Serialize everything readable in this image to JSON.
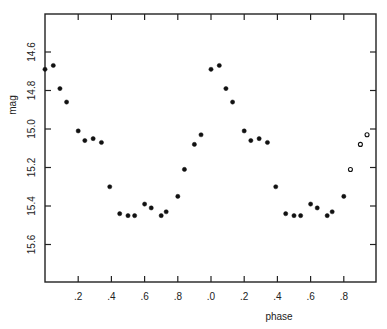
{
  "chart_data": {
    "type": "scatter",
    "title": "",
    "xlabel": "phase",
    "ylabel": "mag",
    "xlim": [
      0.0,
      2.0
    ],
    "ylim": [
      15.8,
      14.5
    ],
    "y_inverted": true,
    "grid": false,
    "legend": null,
    "x_tick_labels": [
      ".2",
      ".4",
      ".6",
      ".8",
      ".0",
      ".2",
      ".4",
      ".6",
      ".8"
    ],
    "x_tick_values": [
      0.2,
      0.4,
      0.6,
      0.8,
      1.0,
      1.2,
      1.4,
      1.6,
      1.8
    ],
    "y_tick_labels": [
      "14.6",
      "14.8",
      "15.0",
      "15.2",
      "15.4",
      "15.6"
    ],
    "y_tick_values": [
      14.6,
      14.8,
      15.0,
      15.2,
      15.4,
      15.6
    ],
    "series": [
      {
        "name": "cycle 1",
        "marker": "filled",
        "x": [
          0.0,
          0.05,
          0.09,
          0.13,
          0.2,
          0.24,
          0.29,
          0.34,
          0.39,
          0.45,
          0.5,
          0.54,
          0.6,
          0.64,
          0.7,
          0.73,
          0.8,
          0.84,
          0.9,
          0.94
        ],
        "y": [
          14.69,
          14.67,
          14.79,
          14.86,
          15.01,
          15.06,
          15.05,
          15.07,
          15.3,
          15.44,
          15.45,
          15.45,
          15.39,
          15.41,
          15.45,
          15.43,
          15.35,
          15.21,
          15.08,
          15.03
        ]
      },
      {
        "name": "cycle 2",
        "marker": "filled",
        "x": [
          1.0,
          1.05,
          1.09,
          1.13,
          1.2,
          1.24,
          1.29,
          1.34,
          1.39,
          1.45,
          1.5,
          1.54,
          1.6,
          1.64,
          1.7,
          1.73,
          1.8
        ],
        "y": [
          14.69,
          14.67,
          14.79,
          14.86,
          15.01,
          15.06,
          15.05,
          15.07,
          15.3,
          15.44,
          15.45,
          15.45,
          15.39,
          15.41,
          15.45,
          15.43,
          15.35
        ]
      },
      {
        "name": "cycle 2 (open markers)",
        "marker": "open",
        "x": [
          1.84,
          1.9,
          1.94
        ],
        "y": [
          15.21,
          15.08,
          15.03
        ]
      }
    ]
  }
}
